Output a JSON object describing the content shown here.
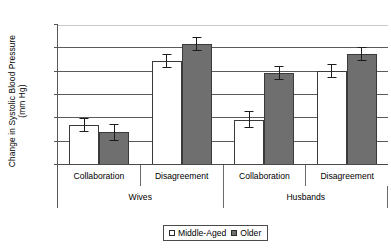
{
  "chart_data": {
    "type": "bar",
    "title": "",
    "subtitle": "",
    "xlabel": "",
    "ylabel_line1": "Change in Systolic Blood Pressure",
    "ylabel_line2": "(mm Hg)",
    "ylim": [
      0,
      12
    ],
    "yticks": [
      0,
      2,
      4,
      6,
      8,
      10,
      12
    ],
    "ytick_labels": [
      "0",
      "2",
      "4",
      "6",
      "8",
      "10",
      "12"
    ],
    "grid": true,
    "grid_axis": "y",
    "legend_position": "bottom-center",
    "categories": [
      "Collaboration",
      "Disagreement",
      "Collaboration",
      "Disagreement"
    ],
    "supergroups": [
      {
        "label": "Wives",
        "span": 2
      },
      {
        "label": "Husbands",
        "span": 2
      }
    ],
    "series": [
      {
        "name": "Middle-Aged",
        "color": "#ffffff",
        "edge_color": "#3a3a3a",
        "values": [
          3.4,
          8.9,
          3.9,
          8.1
        ],
        "errors": [
          0.6,
          0.6,
          0.7,
          0.6
        ]
      },
      {
        "name": "Older",
        "color": "#6f6f6f",
        "edge_color": "#3a3a3a",
        "values": [
          2.8,
          10.4,
          7.9,
          9.5
        ],
        "errors": [
          0.7,
          0.6,
          0.6,
          0.6
        ]
      }
    ]
  },
  "legend": {
    "entries": [
      {
        "label": "Middle-Aged",
        "swatch": "light-square-icon"
      },
      {
        "label": "Older",
        "swatch": "dark-square-icon"
      }
    ]
  }
}
